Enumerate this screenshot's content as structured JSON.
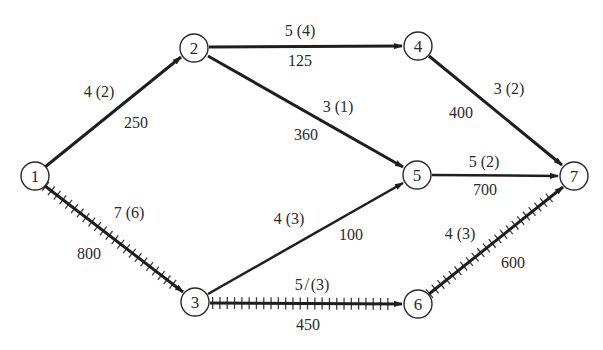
{
  "diagram": {
    "type": "network",
    "nodes": [
      {
        "id": "1",
        "label": "1",
        "x": 35,
        "y": 176
      },
      {
        "id": "2",
        "label": "2",
        "x": 194,
        "y": 48
      },
      {
        "id": "3",
        "label": "3",
        "x": 195,
        "y": 302
      },
      {
        "id": "4",
        "label": "4",
        "x": 418,
        "y": 46
      },
      {
        "id": "5",
        "label": "5",
        "x": 417,
        "y": 175
      },
      {
        "id": "6",
        "label": "6",
        "x": 418,
        "y": 304
      },
      {
        "id": "7",
        "label": "7",
        "x": 574,
        "y": 176
      }
    ],
    "edges": [
      {
        "from": "1",
        "to": "2",
        "top_label": "4 (2)",
        "bottom_label": "250",
        "critical": false
      },
      {
        "from": "1",
        "to": "3",
        "top_label": "7 (6)",
        "bottom_label": "800",
        "critical": true
      },
      {
        "from": "2",
        "to": "4",
        "top_label": "5 (4)",
        "bottom_label": "125",
        "critical": false
      },
      {
        "from": "2",
        "to": "5",
        "top_label": "3 (1)",
        "bottom_label": "360",
        "critical": false
      },
      {
        "from": "3",
        "to": "5",
        "top_label": "4 (3)",
        "bottom_label": "100",
        "critical": false
      },
      {
        "from": "3",
        "to": "6",
        "top_label": "5 ̸ 6 (3)",
        "bottom_label": "450",
        "critical": true
      },
      {
        "from": "4",
        "to": "7",
        "top_label": "3 (2)",
        "bottom_label": "400",
        "critical": false
      },
      {
        "from": "5",
        "to": "7",
        "top_label": "5 (2)",
        "bottom_label": "700",
        "critical": false
      },
      {
        "from": "6",
        "to": "7",
        "top_label": "4 (3)",
        "bottom_label": "600",
        "critical": true
      }
    ],
    "labels": {
      "e12_top": "4 (2)",
      "e12_bot": "250",
      "e13_top": "7 (6)",
      "e13_bot": "800",
      "e24_top": "5 (4)",
      "e24_bot": "125",
      "e25_top": "3 (1)",
      "e25_bot": "360",
      "e35_top": "4 (3)",
      "e35_bot": "100",
      "e36_top": "5 ̸ (3)",
      "e36_bot": "450",
      "e47_top": "3 (2)",
      "e47_bot": "400",
      "e57_top": "5 (2)",
      "e57_bot": "700",
      "e67_top": "4 (3)",
      "e67_bot": "600"
    },
    "colors": {
      "line": "#1e1e1e",
      "text": "#2a2a2a",
      "background": "#ffffff"
    }
  }
}
